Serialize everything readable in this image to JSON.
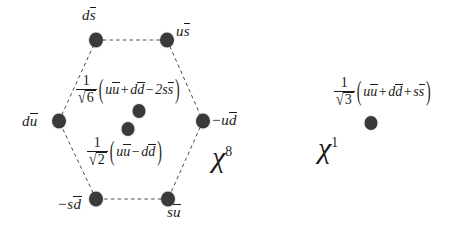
{
  "figure": {
    "background_color": "#ffffff",
    "dot_color": "#3a3a3a",
    "line_color": "#4a4a4a",
    "text_color": "#1b1b1b"
  },
  "octet": {
    "symbol": "χ",
    "superscript": "8",
    "vertex_labels": {
      "top_left": {
        "lead": "d",
        "bar": "s"
      },
      "top_right": {
        "lead": "u",
        "bar": "s"
      },
      "left": {
        "lead": "d",
        "bar": "u"
      },
      "right": {
        "lead": "−u",
        "bar": "d"
      },
      "bottom_left": {
        "lead": "−s",
        "bar": "d"
      },
      "bottom_right": {
        "lead": "s",
        "bar": "u"
      }
    },
    "center_states": [
      {
        "name": "isosinglet-octet-state",
        "coefficient_numerator": "1",
        "coefficient_radicand": "6",
        "terms": [
          {
            "lead": "u",
            "bar": "u",
            "op": ""
          },
          {
            "lead": "d",
            "bar": "d",
            "op": "+"
          },
          {
            "lead": "2s",
            "bar": "s",
            "op": "−"
          }
        ]
      },
      {
        "name": "isotriplet-neutral-state",
        "coefficient_numerator": "1",
        "coefficient_radicand": "2",
        "terms": [
          {
            "lead": "u",
            "bar": "u",
            "op": ""
          },
          {
            "lead": "d",
            "bar": "d",
            "op": "−"
          }
        ]
      }
    ]
  },
  "singlet": {
    "symbol": "χ",
    "superscript": "1",
    "state": {
      "name": "flavour-singlet-state",
      "coefficient_numerator": "1",
      "coefficient_radicand": "3",
      "terms": [
        {
          "lead": "u",
          "bar": "u",
          "op": ""
        },
        {
          "lead": "d",
          "bar": "d",
          "op": "+"
        },
        {
          "lead": "s",
          "bar": "s",
          "op": "+"
        }
      ]
    }
  },
  "glyphs": {
    "sqrt": "√",
    "paren_open": "(",
    "paren_close": ")"
  }
}
